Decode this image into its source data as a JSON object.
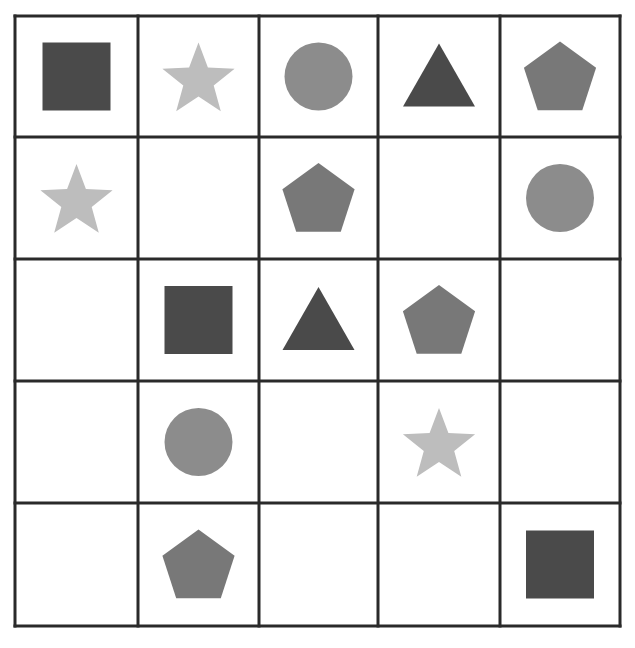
{
  "grid": {
    "rows": 5,
    "cols": 5,
    "col_lines": [
      15,
      138,
      259,
      378,
      500,
      620
    ],
    "row_lines": [
      16,
      137,
      259,
      381,
      503,
      626
    ],
    "line_color": "#2a2a2a"
  },
  "colors": {
    "square": "#4a4a4a",
    "triangle": "#4a4a4a",
    "pentagon": "#787878",
    "circle": "#8c8c8c",
    "star": "#bdbdbd"
  },
  "cells": [
    [
      "square",
      "star",
      "circle",
      "triangle",
      "pentagon"
    ],
    [
      "star",
      "",
      "pentagon",
      "",
      "circle"
    ],
    [
      "",
      "square",
      "triangle",
      "pentagon",
      ""
    ],
    [
      "",
      "circle",
      "",
      "star",
      ""
    ],
    [
      "",
      "pentagon",
      "",
      "",
      "square"
    ]
  ]
}
